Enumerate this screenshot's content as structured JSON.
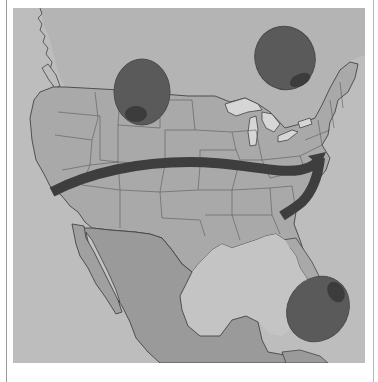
{
  "illustration": {
    "subject": "Map of North America with olives and a curved arrow",
    "alt_text": "Grayscale illustrated map of the United States and Mexico with three green olives and a dark arrow curving west to east",
    "colors": {
      "page_background": "#ffffff",
      "ocean": "#bdbdbd",
      "land_us": "#a9a9a9",
      "land_mexico": "#9a9a9a",
      "land_baja": "#a0a0a0",
      "gulf_water": "#c4c4c4",
      "lakes": "#d6d6d6",
      "borders": "#555555",
      "olive_body": "#5a5a5a",
      "olive_pimento": "#3c3c3c",
      "arrow": "#3e3e3e",
      "frame_line": "#9a9a9a"
    },
    "olives": [
      {
        "name": "olive-north-central",
        "cx": 142,
        "cy": 92,
        "rx": 28,
        "ry": 33
      },
      {
        "name": "olive-northeast",
        "cx": 285,
        "cy": 58,
        "rx": 30,
        "ry": 32
      },
      {
        "name": "olive-caribbean",
        "cx": 318,
        "cy": 309,
        "rx": 30,
        "ry": 34
      }
    ],
    "arrow": {
      "direction": "west-to-east then curving south",
      "label": "route arrow"
    }
  }
}
